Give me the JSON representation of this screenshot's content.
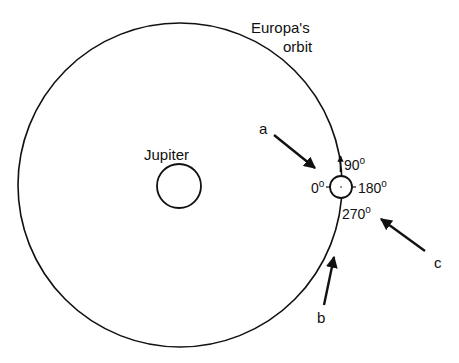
{
  "labels": {
    "orbit_line1": "Europa's",
    "orbit_line2": "orbit",
    "planet": "Jupiter"
  },
  "europa_angles": {
    "left": {
      "value": "0",
      "unit": "o"
    },
    "top": {
      "value": "90",
      "unit": "o"
    },
    "right": {
      "value": "180",
      "unit": "o"
    },
    "bottom": {
      "value": "270",
      "unit": "o"
    }
  },
  "viewing_arrows": [
    {
      "label": "a"
    },
    {
      "label": "b"
    },
    {
      "label": "c"
    }
  ],
  "colors": {
    "ink": "#111111",
    "background": "#ffffff"
  }
}
